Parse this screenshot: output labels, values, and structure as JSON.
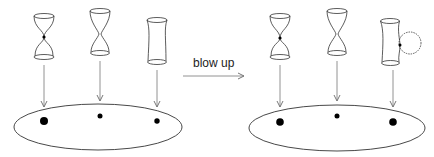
{
  "diagram": {
    "arrow_label": "blow up",
    "colors": {
      "stroke": "#333333",
      "arrow": "#777777",
      "dot": "#000000",
      "background": "#ffffff"
    },
    "panels": [
      {
        "name": "before",
        "fibers": [
          {
            "kind": "pinched-node",
            "has_node_dot": true
          },
          {
            "kind": "hourglass",
            "has_node_dot": false
          },
          {
            "kind": "smooth-cylinder",
            "has_node_dot": false
          }
        ],
        "base_points": [
          "large",
          "small",
          "medium"
        ]
      },
      {
        "name": "after",
        "fibers": [
          {
            "kind": "pinched-node",
            "has_node_dot": true
          },
          {
            "kind": "hourglass",
            "has_node_dot": false
          },
          {
            "kind": "cylinder-with-bubble",
            "has_node_dot": true
          }
        ],
        "base_points": [
          "large",
          "small",
          "large"
        ]
      }
    ]
  }
}
